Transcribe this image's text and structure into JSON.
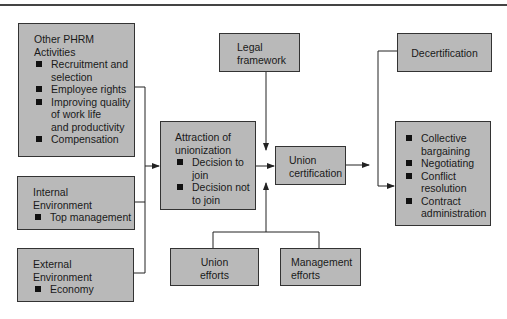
{
  "diagram": {
    "boxes": {
      "other_phrm": {
        "title_line1": "Other PHRM",
        "title_line2": "Activities",
        "items": [
          {
            "line1": "Recruitment and",
            "line2": "selection"
          },
          {
            "line1": "Employee rights",
            "line2": ""
          },
          {
            "line1": "Improving quality",
            "line2": "of work life",
            "line3": "and productivity"
          },
          {
            "line1": "Compensation",
            "line2": ""
          }
        ]
      },
      "internal_env": {
        "title_line1": "Internal",
        "title_line2": "Environment",
        "items": [
          {
            "line1": "Top management"
          }
        ]
      },
      "external_env": {
        "title_line1": "External",
        "title_line2": "Environment",
        "items": [
          {
            "line1": "Economy"
          }
        ]
      },
      "attraction": {
        "title_line1": "Attraction of",
        "title_line2": "unionization",
        "items": [
          {
            "line1": "Decision to",
            "line2": "join"
          },
          {
            "line1": "Decision not",
            "line2": "to join"
          }
        ]
      },
      "legal": {
        "line1": "Legal",
        "line2": "framework"
      },
      "union_cert": {
        "line1": "Union",
        "line2": "certification"
      },
      "union_efforts": {
        "line1": "Union",
        "line2": "efforts"
      },
      "management_efforts": {
        "line1": "Management",
        "line2": "efforts"
      },
      "decertification": {
        "line1": "Decertification"
      },
      "outcomes": {
        "items": [
          {
            "line1": "Collective",
            "line2": "bargaining"
          },
          {
            "line1": "Negotiating",
            "line2": ""
          },
          {
            "line1": "Conflict",
            "line2": "resolution"
          },
          {
            "line1": "Contract",
            "line2": "administration"
          }
        ]
      }
    },
    "colors": {
      "box_fill": "#b9b9b9",
      "border": "#333333",
      "line": "#222222"
    }
  }
}
